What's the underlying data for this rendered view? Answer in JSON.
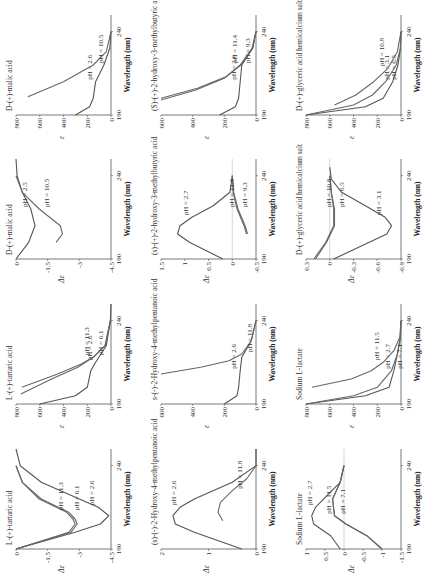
{
  "chart_data": [
    {
      "id": "tart_cd",
      "type": "line",
      "title": "L-(+)-tartaric acid",
      "xlabel": "Wavelength (nm)",
      "ylabel": "Δε",
      "xlim": [
        190,
        250
      ],
      "ylim": [
        -4.5,
        0
      ],
      "yticks": [
        "0",
        "-1.5",
        "-3",
        "-4.5"
      ],
      "xticks": [
        "190",
        "240"
      ],
      "series": [
        {
          "name": "pH = 2.6",
          "x": [
            190,
            200,
            205,
            210,
            215,
            220,
            230,
            240,
            250
          ],
          "y": [
            0,
            -2.8,
            -4.0,
            -4.4,
            -3.9,
            -3.0,
            -1.2,
            -0.2,
            0
          ]
        },
        {
          "name": "pH = 6.1",
          "x": [
            190,
            200,
            205,
            208,
            212,
            220,
            230,
            240
          ],
          "y": [
            0,
            -2.6,
            -2.9,
            -2.8,
            -2.5,
            -1.2,
            -0.3,
            0
          ]
        },
        {
          "name": "pH = 11.3",
          "x": [
            190,
            200,
            205,
            208,
            212,
            220,
            230,
            240
          ],
          "y": [
            0,
            -2.5,
            -2.8,
            -2.7,
            -2.4,
            -1.1,
            -0.3,
            0
          ]
        }
      ]
    },
    {
      "id": "tart_abs",
      "type": "line",
      "title": "L-(+)-tartaric acid",
      "xlabel": "Wavelength (nm)",
      "ylabel": "ε",
      "xlim": [
        190,
        250
      ],
      "ylim": [
        0,
        800
      ],
      "yticks": [
        "800",
        "600",
        "400",
        "200",
        "0"
      ],
      "xticks": [
        "190",
        "240"
      ],
      "series": [
        {
          "name": "pH = 2.6",
          "x": [
            190,
            195,
            200,
            210,
            215,
            225,
            240,
            250
          ],
          "y": [
            600,
            300,
            200,
            170,
            130,
            40,
            5,
            0
          ]
        },
        {
          "name": "pH = 6.1",
          "x": [
            196,
            205,
            212,
            218,
            225,
            240
          ],
          "y": [
            760,
            500,
            280,
            150,
            50,
            5
          ]
        },
        {
          "name": "pH = 11.3",
          "x": [
            200,
            208,
            214,
            218,
            225,
            240
          ],
          "y": [
            750,
            450,
            250,
            150,
            50,
            5
          ]
        }
      ]
    },
    {
      "id": "malic_cd",
      "type": "line",
      "title": "D-(+)-malic acid",
      "xlabel": "Wavelength (nm)",
      "ylabel": "Δε",
      "xlim": [
        190,
        250
      ],
      "ylim": [
        -4.5,
        0
      ],
      "yticks": [
        "0",
        "-1.5",
        "-3",
        "-4.5"
      ],
      "xticks": [
        "190",
        "240"
      ],
      "series": [
        {
          "name": "pH = 2.5",
          "x": [
            190,
            200,
            210,
            220,
            230,
            240,
            250
          ],
          "y": [
            0,
            -0.6,
            -0.9,
            -0.7,
            -0.3,
            -0.05,
            0
          ]
        },
        {
          "name": "pH = 10.5",
          "x": [
            200,
            205,
            210,
            220,
            230,
            240
          ],
          "y": [
            -1.9,
            -2.2,
            -2.1,
            -1.1,
            -0.3,
            0
          ]
        }
      ]
    },
    {
      "id": "malic_abs",
      "type": "line",
      "title": "D-(+)-malic acid",
      "xlabel": "Wavelength (nm)",
      "ylabel": "ε",
      "xlim": [
        190,
        250
      ],
      "ylim": [
        0,
        800
      ],
      "yticks": [
        "800",
        "600",
        "400",
        "200",
        "0"
      ],
      "xticks": [
        "190",
        "240"
      ],
      "series": [
        {
          "name": "pH = 2.6",
          "x": [
            190,
            195,
            200,
            210,
            220,
            230,
            240
          ],
          "y": [
            300,
            180,
            150,
            130,
            60,
            10,
            0
          ]
        },
        {
          "name": "pH = 10.5",
          "x": [
            201,
            210,
            220,
            228,
            240
          ],
          "y": [
            700,
            400,
            150,
            40,
            0
          ]
        }
      ]
    },
    {
      "id": "mp_cd",
      "type": "line",
      "title": "(s)-(-)-2-Hydroxy-4-methylpentanoic acid",
      "xlabel": "Wavelength (nm)",
      "ylabel": "Δε",
      "xlim": [
        190,
        250
      ],
      "ylim": [
        0,
        2
      ],
      "yticks": [
        "2",
        "1",
        "0"
      ],
      "xticks": [
        "190",
        "240"
      ],
      "series": [
        {
          "name": "pH = 2.6",
          "x": [
            190,
            200,
            205,
            210,
            215,
            220,
            230,
            240,
            250
          ],
          "y": [
            0.3,
            1.3,
            1.7,
            1.75,
            1.6,
            1.3,
            0.5,
            0,
            0
          ]
        },
        {
          "name": "pH = 11.8",
          "x": [
            207,
            212,
            218,
            225,
            232,
            240
          ],
          "y": [
            0.7,
            0.8,
            0.75,
            0.5,
            0.2,
            0
          ]
        }
      ]
    },
    {
      "id": "mp_abs",
      "type": "line",
      "title": "s-(-)-2-Hydroxy-4-methylpentanoic acid",
      "xlabel": "Wavelength (nm)",
      "ylabel": "ε",
      "xlim": [
        190,
        250
      ],
      "ylim": [
        0,
        600
      ],
      "yticks": [
        "600",
        "400",
        "200",
        "0"
      ],
      "xticks": [
        "190",
        "240"
      ],
      "series": [
        {
          "name": "pH = 2.6",
          "x": [
            190,
            195,
            200,
            210,
            218,
            228,
            240
          ],
          "y": [
            200,
            120,
            110,
            100,
            90,
            30,
            0
          ]
        },
        {
          "name": "pH = 11.8",
          "x": [
            208,
            212,
            216,
            220,
            228,
            240
          ],
          "y": [
            600,
            350,
            170,
            90,
            30,
            0
          ]
        }
      ]
    },
    {
      "id": "mb_cd",
      "type": "line",
      "title": "(s)-(+)-2-hydroxy-3-methylbutyric acid",
      "xlabel": "Wavelength (nm)",
      "ylabel": "Δε",
      "xlim": [
        190,
        250
      ],
      "ylim": [
        -0.5,
        1.5
      ],
      "yticks": [
        "1.5",
        "1",
        "0.5",
        "0",
        "-0.5"
      ],
      "xticks": [
        "190",
        "240"
      ],
      "series": [
        {
          "name": "pH = 2.7",
          "x": [
            190,
            200,
            205,
            210,
            215,
            222,
            230,
            240
          ],
          "y": [
            0.2,
            0.9,
            1.15,
            1.1,
            0.85,
            0.4,
            0.05,
            0
          ]
        },
        {
          "name": "pH = 9.3",
          "x": [
            205,
            210,
            220,
            230,
            240
          ],
          "y": [
            -0.3,
            -0.25,
            -0.1,
            -0.02,
            0
          ]
        },
        {
          "name": "pH = 11.4",
          "x": [
            205,
            210,
            220,
            230,
            240
          ],
          "y": [
            -0.32,
            -0.27,
            -0.12,
            -0.03,
            0
          ]
        }
      ]
    },
    {
      "id": "mb_abs",
      "type": "line",
      "title": "(S)-(+)-2-hydroxy-3-methylbutyric acid",
      "xlabel": "Wavelength (nm)",
      "ylabel": "ε",
      "xlim": [
        190,
        250
      ],
      "ylim": [
        0,
        600
      ],
      "yticks": [
        "600",
        "400",
        "200",
        "0"
      ],
      "xticks": [
        "190",
        "240"
      ],
      "series": [
        {
          "name": "pH = 2.6",
          "x": [
            190,
            195,
            200,
            210,
            220,
            230,
            240
          ],
          "y": [
            230,
            130,
            110,
            100,
            90,
            20,
            0
          ]
        },
        {
          "name": "pH = 9.3",
          "x": [
            199,
            205,
            212,
            220,
            230,
            240
          ],
          "y": [
            600,
            380,
            200,
            100,
            25,
            0
          ]
        },
        {
          "name": "pH = 11.4",
          "x": [
            200,
            206,
            213,
            220,
            230,
            240
          ],
          "y": [
            600,
            370,
            190,
            95,
            22,
            0
          ]
        }
      ]
    },
    {
      "id": "lac_cd",
      "type": "line",
      "title": "Sodium L-lactate",
      "xlabel": "Wavelength (nm)",
      "ylabel": "Δε",
      "xlim": [
        190,
        250
      ],
      "ylim": [
        -1.5,
        1
      ],
      "yticks": [
        "1",
        "0.5",
        "0",
        "-0.5",
        "-1",
        "-1.5"
      ],
      "xticks": [
        "190",
        "240"
      ],
      "series": [
        {
          "name": "pH = 2.7",
          "x": [
            190,
            198,
            205,
            210,
            215,
            222,
            230,
            240
          ],
          "y": [
            0.1,
            0.35,
            0.8,
            0.85,
            0.75,
            0.45,
            0.1,
            0
          ]
        },
        {
          "name": "pH = 7.1",
          "x": [
            190,
            198,
            205,
            210,
            220,
            230,
            240
          ],
          "y": [
            -1.0,
            -0.6,
            -0.05,
            0.25,
            0.3,
            0.1,
            0
          ]
        },
        {
          "name": "pH = 11.5",
          "x": [
            190,
            198,
            205,
            210,
            220,
            230,
            240
          ],
          "y": [
            -1.0,
            -0.6,
            -0.05,
            0.25,
            0.3,
            0.1,
            0
          ]
        }
      ]
    },
    {
      "id": "lac_abs",
      "type": "line",
      "title": "Sodium L-lactate",
      "xlabel": "Wavelength (nm)",
      "ylabel": "ε",
      "xlim": [
        190,
        250
      ],
      "ylim": [
        0,
        800
      ],
      "yticks": [
        "800",
        "600",
        "400",
        "200",
        "0"
      ],
      "xticks": [
        "190",
        "240"
      ],
      "series": [
        {
          "name": "pH = 2.7",
          "x": [
            190,
            195,
            200,
            210,
            220,
            230,
            240
          ],
          "y": [
            800,
            300,
            100,
            60,
            30,
            5,
            0
          ]
        },
        {
          "name": "pH = 7.1",
          "x": [
            190,
            195,
            200,
            210,
            220,
            230,
            240
          ],
          "y": [
            800,
            400,
            200,
            80,
            30,
            5,
            0
          ]
        },
        {
          "name": "pH = 11.5",
          "x": [
            200,
            205,
            210,
            215,
            222,
            230,
            240
          ],
          "y": [
            750,
            420,
            250,
            150,
            60,
            10,
            0
          ]
        }
      ]
    },
    {
      "id": "gly_cd",
      "type": "line",
      "title": "D-(+)-glyceric acid hemicalcium salt",
      "xlabel": "Wavelength (nm)",
      "ylabel": "Δε",
      "xlim": [
        190,
        250
      ],
      "ylim": [
        -0.9,
        0.3
      ],
      "yticks": [
        "0.3",
        "0",
        "-0.3",
        "-0.6",
        "-0.9"
      ],
      "xticks": [
        "190",
        "240"
      ],
      "series": [
        {
          "name": "pH = 3.1",
          "x": [
            190,
            200,
            205,
            210,
            215,
            222,
            230,
            238,
            245
          ],
          "y": [
            -0.05,
            -0.5,
            -0.72,
            -0.78,
            -0.7,
            -0.45,
            -0.15,
            -0.02,
            0
          ]
        },
        {
          "name": "pH = 6.5",
          "x": [
            190,
            200,
            210,
            220,
            230,
            240
          ],
          "y": [
            0.2,
            0.05,
            -0.05,
            -0.05,
            -0.02,
            0
          ]
        },
        {
          "name": "pH = 10.8",
          "x": [
            190,
            200,
            210,
            220,
            230,
            240
          ],
          "y": [
            0.18,
            0.04,
            -0.06,
            -0.06,
            -0.02,
            0
          ]
        }
      ]
    },
    {
      "id": "gly_abs",
      "type": "line",
      "title": "D-(+)-glyceric acid hemicalcium salt",
      "xlabel": "Wavelength (nm)",
      "ylabel": "ε",
      "xlim": [
        190,
        250
      ],
      "ylim": [
        0,
        800
      ],
      "yticks": [
        "800",
        "600",
        "400",
        "200",
        "0"
      ],
      "xticks": [
        "190",
        "240"
      ],
      "series": [
        {
          "name": "pH = 3.1",
          "x": [
            190,
            195,
            200,
            210,
            220,
            230,
            240
          ],
          "y": [
            800,
            300,
            150,
            70,
            25,
            5,
            0
          ]
        },
        {
          "name": "pH = 6.5",
          "x": [
            190,
            196,
            202,
            210,
            220,
            230,
            240
          ],
          "y": [
            800,
            400,
            240,
            130,
            40,
            5,
            0
          ]
        },
        {
          "name": "pH = 10.8",
          "x": [
            196,
            202,
            210,
            218,
            228,
            240
          ],
          "y": [
            560,
            380,
            230,
            110,
            30,
            0
          ]
        }
      ]
    }
  ],
  "labels": {
    "xlabel": "Wavelength (nm)"
  }
}
